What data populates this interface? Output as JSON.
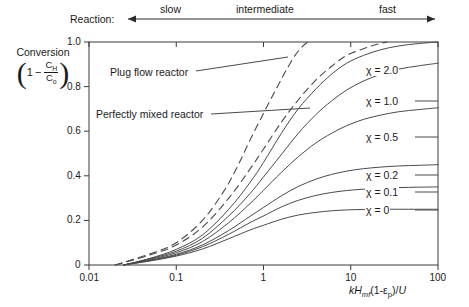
{
  "chart_data": {
    "type": "line",
    "title": "",
    "xlabel": "kHmf(1-εp)/U",
    "ylabel": "Conversion (1 - CH/Co)",
    "xscale": "log",
    "xlim": [
      0.01,
      100
    ],
    "ylim": [
      0,
      1.0
    ],
    "xticks": [
      "0.01",
      "0.1",
      "1",
      "10",
      "100"
    ],
    "yticks": [
      "0",
      "0.2",
      "0.4",
      "0.6",
      "0.8",
      "1.0"
    ],
    "grid": false,
    "legend_position": "inline-right-labels",
    "top_axis_annotation": {
      "prefix": "Reaction:",
      "segments": [
        "slow",
        "intermediate",
        "fast"
      ],
      "left_arrow": true,
      "right_arrow": true
    },
    "annotations": [
      {
        "text": "Plug flow reactor",
        "style": "dashed-curve-callout"
      },
      {
        "text": "Perfectly mixed reactor",
        "style": "dashed-curve-callout"
      }
    ],
    "series": [
      {
        "name": "Plug flow reactor",
        "style": "dashed",
        "label": "",
        "points": [
          [
            0.02,
            0.0
          ],
          [
            0.05,
            0.05
          ],
          [
            0.1,
            0.1
          ],
          [
            0.2,
            0.2
          ],
          [
            0.35,
            0.33
          ],
          [
            0.5,
            0.44
          ],
          [
            0.7,
            0.56
          ],
          [
            1.0,
            0.68
          ],
          [
            1.4,
            0.79
          ],
          [
            1.8,
            0.87
          ],
          [
            2.3,
            0.94
          ],
          [
            2.8,
            0.98
          ],
          [
            3.2,
            1.0
          ]
        ]
      },
      {
        "name": "Perfectly mixed reactor",
        "style": "dashed",
        "label": "",
        "points": [
          [
            0.02,
            0.0
          ],
          [
            0.05,
            0.045
          ],
          [
            0.1,
            0.09
          ],
          [
            0.2,
            0.17
          ],
          [
            0.4,
            0.3
          ],
          [
            0.7,
            0.43
          ],
          [
            1.0,
            0.52
          ],
          [
            1.6,
            0.64
          ],
          [
            2.5,
            0.74
          ],
          [
            4.0,
            0.83
          ],
          [
            6.0,
            0.89
          ],
          [
            9.0,
            0.94
          ],
          [
            14.0,
            0.97
          ],
          [
            20.0,
            0.99
          ],
          [
            26.0,
            1.0
          ]
        ]
      },
      {
        "name": "χ = 2.0",
        "style": "solid",
        "label": "χ = 2.0",
        "points": [
          [
            0.025,
            0.0
          ],
          [
            0.05,
            0.03
          ],
          [
            0.1,
            0.07
          ],
          [
            0.2,
            0.135
          ],
          [
            0.4,
            0.25
          ],
          [
            0.7,
            0.37
          ],
          [
            1.0,
            0.46
          ],
          [
            1.6,
            0.59
          ],
          [
            2.5,
            0.7
          ],
          [
            4.0,
            0.79
          ],
          [
            6.0,
            0.855
          ],
          [
            9.0,
            0.905
          ],
          [
            14.0,
            0.94
          ],
          [
            22.0,
            0.965
          ],
          [
            35.0,
            0.982
          ],
          [
            60.0,
            0.993
          ],
          [
            100.0,
            1.0
          ]
        ]
      },
      {
        "name": "χ = 1.0",
        "style": "solid",
        "label": "χ = 1.0",
        "points": [
          [
            0.025,
            0.0
          ],
          [
            0.05,
            0.028
          ],
          [
            0.1,
            0.062
          ],
          [
            0.2,
            0.12
          ],
          [
            0.4,
            0.22
          ],
          [
            0.7,
            0.32
          ],
          [
            1.0,
            0.395
          ],
          [
            1.6,
            0.495
          ],
          [
            2.5,
            0.59
          ],
          [
            4.0,
            0.675
          ],
          [
            6.0,
            0.735
          ],
          [
            9.0,
            0.785
          ],
          [
            14.0,
            0.825
          ],
          [
            22.0,
            0.855
          ],
          [
            35.0,
            0.878
          ],
          [
            60.0,
            0.893
          ],
          [
            100.0,
            0.905
          ]
        ]
      },
      {
        "name": "χ = 0.5",
        "style": "solid",
        "label": "χ = 0.5",
        "points": [
          [
            0.025,
            0.0
          ],
          [
            0.05,
            0.025
          ],
          [
            0.1,
            0.055
          ],
          [
            0.2,
            0.105
          ],
          [
            0.4,
            0.19
          ],
          [
            0.7,
            0.275
          ],
          [
            1.0,
            0.335
          ],
          [
            1.6,
            0.415
          ],
          [
            2.5,
            0.485
          ],
          [
            4.0,
            0.548
          ],
          [
            6.0,
            0.59
          ],
          [
            9.0,
            0.625
          ],
          [
            14.0,
            0.653
          ],
          [
            22.0,
            0.672
          ],
          [
            35.0,
            0.687
          ],
          [
            60.0,
            0.697
          ],
          [
            100.0,
            0.705
          ]
        ]
      },
      {
        "name": "χ = 0.2",
        "style": "solid",
        "label": "χ = 0.2",
        "points": [
          [
            0.025,
            0.0
          ],
          [
            0.05,
            0.022
          ],
          [
            0.1,
            0.048
          ],
          [
            0.2,
            0.09
          ],
          [
            0.4,
            0.155
          ],
          [
            0.7,
            0.218
          ],
          [
            1.0,
            0.258
          ],
          [
            1.6,
            0.31
          ],
          [
            2.5,
            0.352
          ],
          [
            4.0,
            0.385
          ],
          [
            6.0,
            0.406
          ],
          [
            9.0,
            0.421
          ],
          [
            14.0,
            0.432
          ],
          [
            22.0,
            0.439
          ],
          [
            35.0,
            0.444
          ],
          [
            60.0,
            0.447
          ],
          [
            100.0,
            0.45
          ]
        ]
      },
      {
        "name": "χ = 0.1",
        "style": "solid",
        "label": "χ = 0.1",
        "points": [
          [
            0.025,
            0.0
          ],
          [
            0.05,
            0.02
          ],
          [
            0.1,
            0.044
          ],
          [
            0.2,
            0.082
          ],
          [
            0.4,
            0.138
          ],
          [
            0.7,
            0.19
          ],
          [
            1.0,
            0.22
          ],
          [
            1.6,
            0.26
          ],
          [
            2.5,
            0.29
          ],
          [
            4.0,
            0.312
          ],
          [
            6.0,
            0.325
          ],
          [
            9.0,
            0.334
          ],
          [
            14.0,
            0.34
          ],
          [
            22.0,
            0.344
          ],
          [
            35.0,
            0.347
          ],
          [
            60.0,
            0.349
          ],
          [
            100.0,
            0.35
          ]
        ]
      },
      {
        "name": "χ = 0",
        "style": "solid",
        "label": "χ = 0",
        "points": [
          [
            0.025,
            0.0
          ],
          [
            0.05,
            0.018
          ],
          [
            0.1,
            0.04
          ],
          [
            0.2,
            0.072
          ],
          [
            0.4,
            0.118
          ],
          [
            0.7,
            0.157
          ],
          [
            1.0,
            0.178
          ],
          [
            1.6,
            0.205
          ],
          [
            2.5,
            0.224
          ],
          [
            4.0,
            0.236
          ],
          [
            6.0,
            0.243
          ],
          [
            9.0,
            0.247
          ],
          [
            14.0,
            0.249
          ],
          [
            22.0,
            0.25
          ],
          [
            35.0,
            0.25
          ],
          [
            60.0,
            0.25
          ],
          [
            100.0,
            0.25
          ]
        ]
      }
    ]
  },
  "axis": {
    "y_title_line1": "Conversion",
    "y_frac_one": "1",
    "y_frac_minus": "−",
    "y_frac_num": "C",
    "y_frac_num_sub": "H",
    "y_frac_den": "C",
    "y_frac_den_sub": "o",
    "x_title_k": "k",
    "x_title_H": "H",
    "x_title_H_sub": "mf",
    "x_title_rest": "(1-",
    "x_title_eps": "ε",
    "x_title_eps_sub": "p",
    "x_title_tail": ")/",
    "x_title_U": "U"
  },
  "reaction": {
    "prefix": "Reaction:",
    "slow": "slow",
    "intermediate": "intermediate",
    "fast": "fast"
  },
  "colors": {
    "axis": "#3a3a3a",
    "curve": "#4a4a4a",
    "text": "#1a1a1a",
    "background": "#ffffff"
  }
}
